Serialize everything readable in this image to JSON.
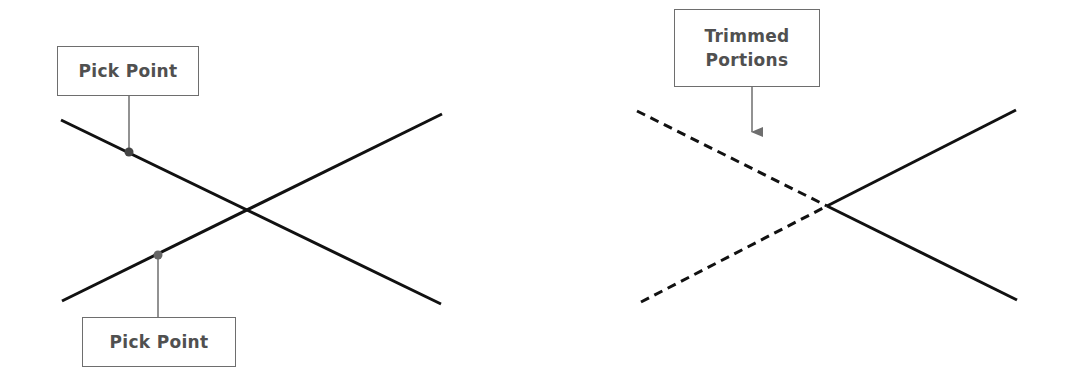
{
  "diagram": {
    "before": {
      "labels": {
        "pick_point_top": "Pick Point",
        "pick_point_bottom": "Pick Point"
      },
      "lines": [
        {
          "name": "line-a",
          "from": [
            61,
            120
          ],
          "to": [
            441,
            304
          ],
          "style": "solid"
        },
        {
          "name": "line-b",
          "from": [
            62,
            301
          ],
          "to": [
            442,
            114
          ],
          "style": "solid"
        }
      ],
      "intersection": [
        247,
        210
      ],
      "pick_points": [
        [
          129,
          152
        ],
        [
          158,
          255
        ]
      ]
    },
    "after": {
      "labels": {
        "trimmed_line1": "Trimmed",
        "trimmed_line2": "Portions"
      },
      "lines": [
        {
          "name": "trimmed-a",
          "from": [
            637,
            111
          ],
          "to": [
            827,
            206
          ],
          "style": "dashed"
        },
        {
          "name": "trimmed-b",
          "from": [
            641,
            302
          ],
          "to": [
            827,
            206
          ],
          "style": "dashed"
        },
        {
          "name": "kept-a",
          "from": [
            827,
            206
          ],
          "to": [
            1016,
            110
          ],
          "style": "solid"
        },
        {
          "name": "kept-b",
          "from": [
            827,
            206
          ],
          "to": [
            1017,
            300
          ],
          "style": "solid"
        }
      ],
      "intersection": [
        827,
        206
      ]
    },
    "colors": {
      "line": "#111111",
      "callout": "#6e6e6e",
      "label_text": "#505050",
      "background": "#ffffff"
    }
  }
}
